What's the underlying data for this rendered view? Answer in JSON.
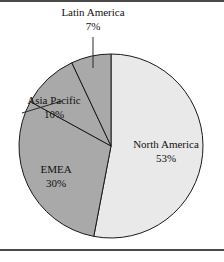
{
  "figure": {
    "background_color": "#ffffff",
    "rule_color": "#4a4a4a",
    "outline_color": "#1a1a1a"
  },
  "chart_data": {
    "type": "pie",
    "title": "",
    "subtitle": "",
    "xlabel": "",
    "ylabel": "",
    "legend_position": "none",
    "grid": false,
    "start_angle_deg": 0,
    "direction": "clockwise",
    "unit": "%",
    "categories": [
      "North America",
      "EMEA",
      "Asia Pacific",
      "Latin America"
    ],
    "values": [
      53,
      30,
      10,
      7
    ],
    "slices": [
      {
        "label": "North America",
        "value": 53,
        "value_text": "53%",
        "color": "#e9e9e9",
        "label_placement": "inside",
        "has_leader_line": false
      },
      {
        "label": "EMEA",
        "value": 30,
        "value_text": "30%",
        "color": "#a9a9a9",
        "label_placement": "inside",
        "has_leader_line": false
      },
      {
        "label": "Asia Pacific",
        "value": 10,
        "value_text": "10%",
        "color": "#a9a9a9",
        "label_placement": "outside",
        "has_leader_line": true
      },
      {
        "label": "Latin America",
        "value": 7,
        "value_text": "7%",
        "color": "#a9a9a9",
        "label_placement": "outside",
        "has_leader_line": true
      }
    ]
  },
  "labels": {
    "latin_america": {
      "name": "Latin America",
      "value": "7%"
    },
    "asia_pacific": {
      "name": "Asia Pacific",
      "value": "10%"
    },
    "emea": {
      "name": "EMEA",
      "value": "30%"
    },
    "north_america": {
      "name": "North America",
      "value": "53%"
    }
  }
}
